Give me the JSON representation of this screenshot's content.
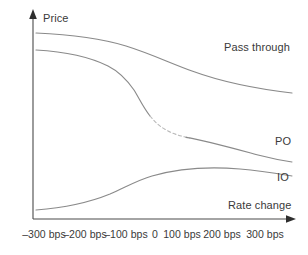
{
  "chart_data": {
    "type": "line",
    "title": "",
    "subtitle": "",
    "xlabel": "Rate change",
    "ylabel": "Price",
    "grid": false,
    "legend_position": "inline-right-of-curves",
    "x": [
      -300,
      -200,
      -100,
      0,
      100,
      200,
      300
    ],
    "tick_labels": [
      "–300 bps",
      "–200 bps",
      "–100 bps",
      "0",
      "100 bps",
      "200 bps",
      "300 bps"
    ],
    "xlim": [
      -330,
      330
    ],
    "ylim": [
      0,
      100
    ],
    "axis_style": "arrowed-half-axes",
    "series": [
      {
        "name": "Pass through",
        "label": "Pass through",
        "color": "#8a8a8a",
        "style": "solid",
        "values": [
          92,
          90,
          86,
          79,
          70,
          62,
          55
        ]
      },
      {
        "name": "PO",
        "label": "PO",
        "color": "#8a8a8a",
        "style": "solid-with-faded-inflection",
        "values": [
          83,
          78,
          66,
          48,
          38,
          33,
          28
        ],
        "faded_segment_x": [
          40,
          130
        ],
        "note": "steep decline between -100 bps and 100 bps; segment rendered faint/dashed"
      },
      {
        "name": "IO",
        "label": "IO",
        "color": "#8a8a8a",
        "style": "solid",
        "values": [
          5,
          8,
          14,
          22,
          26,
          28,
          30
        ]
      }
    ]
  },
  "axes": {
    "y_title": "Price",
    "x_title": "Rate change"
  },
  "ticks": [
    {
      "label": "–300 bps",
      "x_px": 44
    },
    {
      "label": "–200 bps",
      "x_px": 85
    },
    {
      "label": "–100 bps",
      "x_px": 126
    },
    {
      "label": "0",
      "x_px": 155
    },
    {
      "label": "100 bps",
      "x_px": 182
    },
    {
      "label": "200 bps",
      "x_px": 222
    },
    {
      "label": "300 bps",
      "x_px": 265
    }
  ],
  "series_labels": {
    "pass_through": "Pass through",
    "po": "PO",
    "io": "IO"
  },
  "colors": {
    "curve": "#8a8a8a",
    "axis": "#4a4a4a",
    "text": "#3a3a3a",
    "background": "#ffffff"
  }
}
